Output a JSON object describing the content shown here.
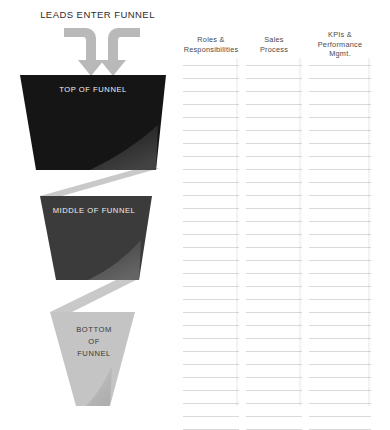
{
  "diagram": {
    "leads_title": "LEADS ENTER FUNNEL",
    "stages": [
      {
        "id": "top-of-funnel",
        "label": "TOP OF FUNNEL",
        "fill": "#151515"
      },
      {
        "id": "middle-of-funnel",
        "label": "MIDDLE OF FUNNEL",
        "fill": "#3b3b3b"
      },
      {
        "id": "bottom-of-funnel",
        "label": "BOTTOM\nOF\nFUNNEL",
        "fill": "#c4c4c4"
      }
    ],
    "connector_color": "#c9c9c9",
    "arrow_color": "#b9b9b9"
  },
  "columns": [
    {
      "id": "roles-responsibilities",
      "header": "Roles &\nResponsibilities",
      "rule_count": 28
    },
    {
      "id": "sales-process",
      "header": "Sales\nProcess",
      "rule_count": 28
    },
    {
      "id": "kpis-performance-mgmt",
      "header": "KPIs &\nPerformance\nMgmt.",
      "rule_count": 28
    }
  ],
  "palette": {
    "background": "#ffffff",
    "rule_line": "#d8dadb",
    "header_text": "#4a4a4a"
  }
}
